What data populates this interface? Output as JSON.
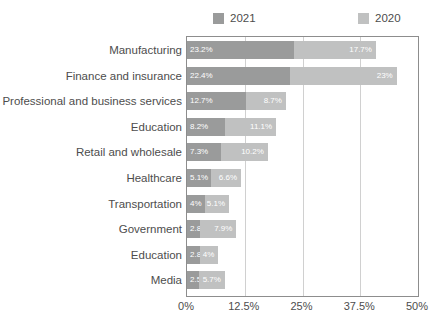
{
  "chart_data": {
    "type": "bar",
    "subtype": "horizontal-stacked-bar",
    "title": "",
    "xlabel": "",
    "ylabel": "",
    "xlim": [
      0,
      50
    ],
    "xticks": [
      "0%",
      "12.5%",
      "25%",
      "37.5%",
      "50%"
    ],
    "xtick_values": [
      0,
      12.5,
      25,
      37.5,
      50
    ],
    "grid": true,
    "legend_position": "top",
    "categories": [
      "Manufacturing",
      "Finance and insurance",
      "Professional and business services",
      "Education",
      "Retail and wholesale",
      "Healthcare",
      "Transportation",
      "Government",
      "Education",
      "Media"
    ],
    "series": [
      {
        "name": "2021",
        "color": "#9a9b9b",
        "values": [
          23.2,
          22.4,
          12.7,
          8.2,
          7.3,
          5.1,
          4,
          2.8,
          2.8,
          2.5
        ],
        "labels": [
          "23.2%",
          "22.4%",
          "12.7%",
          "8.2%",
          "7.3%",
          "5.1%",
          "4%",
          "2.8%",
          "2.8%",
          "2.5%"
        ]
      },
      {
        "name": "2020",
        "color": "#c0c1c1",
        "values": [
          17.7,
          23,
          8.7,
          11.1,
          10.2,
          6.6,
          5.1,
          7.9,
          4,
          5.7
        ],
        "labels": [
          "17.7%",
          "23%",
          "8.7%",
          "11.1%",
          "10.2%",
          "6.6%",
          "5.1%",
          "7.9%",
          "4%",
          "5.7%"
        ]
      }
    ]
  },
  "legend": {
    "items": [
      {
        "label": "2021",
        "color": "#9a9b9b"
      },
      {
        "label": "2020",
        "color": "#c0c1c1"
      }
    ]
  },
  "colors": {
    "series_2021": "#9a9b9b",
    "series_2020": "#c0c1c1",
    "frame": "#8d8d8d",
    "gridline": "#d0d0d0",
    "text": "#4d4d4d",
    "label_text": "#ffffff",
    "background": "#ffffff"
  }
}
